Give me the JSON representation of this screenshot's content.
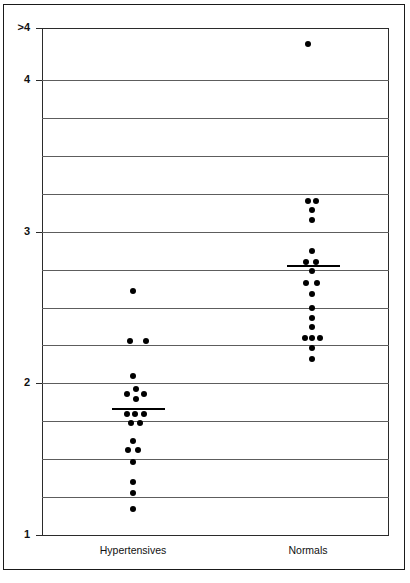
{
  "chart_data": {
    "type": "scatter",
    "title": "",
    "xlabel": "",
    "ylabel": "Average Rapid Left Ventricular Filling Rate (end-diastolic counts/sec)",
    "ylim": [
      1,
      4.35
    ],
    "ytick_labels": [
      ">4",
      "4",
      "3",
      "2",
      "1"
    ],
    "ytick_values": [
      4.34,
      4,
      3,
      2,
      1
    ],
    "gridlines": [
      4.0,
      3.75,
      3.5,
      3.25,
      3.0,
      2.75,
      2.5,
      2.25,
      2.0,
      1.75,
      1.5,
      1.25,
      1.0
    ],
    "grid": true,
    "legend": "none",
    "categories": [
      "Hypertensives",
      "Normals"
    ],
    "series": [
      {
        "name": "Hypertensives",
        "mean": 1.84,
        "n": 18,
        "points": [
          {
            "x": 0.0,
            "y": 2.61
          },
          {
            "x": -0.02,
            "y": 2.28
          },
          {
            "x": 0.085,
            "y": 2.28
          },
          {
            "x": 0.0,
            "y": 2.05
          },
          {
            "x": -0.04,
            "y": 1.93
          },
          {
            "x": 0.02,
            "y": 1.96
          },
          {
            "x": 0.02,
            "y": 1.9
          },
          {
            "x": 0.075,
            "y": 1.93
          },
          {
            "x": -0.04,
            "y": 1.8
          },
          {
            "x": 0.015,
            "y": 1.8
          },
          {
            "x": 0.075,
            "y": 1.8
          },
          {
            "x": -0.015,
            "y": 1.74
          },
          {
            "x": 0.045,
            "y": 1.74
          },
          {
            "x": 0.0,
            "y": 1.62
          },
          {
            "x": -0.035,
            "y": 1.56
          },
          {
            "x": 0.035,
            "y": 1.56
          },
          {
            "x": 0.0,
            "y": 1.48
          },
          {
            "x": 0.0,
            "y": 1.35
          },
          {
            "x": 0.0,
            "y": 1.28
          },
          {
            "x": 0.0,
            "y": 1.17
          }
        ]
      },
      {
        "name": "Normals",
        "mean": 2.78,
        "n": 20,
        "points": [
          {
            "x": 0.0,
            "y": 4.24
          },
          {
            "x": 0.0,
            "y": 3.2
          },
          {
            "x": 0.055,
            "y": 3.2
          },
          {
            "x": 0.025,
            "y": 3.14
          },
          {
            "x": 0.025,
            "y": 3.08
          },
          {
            "x": 0.025,
            "y": 2.87
          },
          {
            "x": -0.01,
            "y": 2.8
          },
          {
            "x": 0.055,
            "y": 2.8
          },
          {
            "x": 0.025,
            "y": 2.74
          },
          {
            "x": -0.01,
            "y": 2.66
          },
          {
            "x": 0.06,
            "y": 2.66
          },
          {
            "x": 0.025,
            "y": 2.59
          },
          {
            "x": 0.025,
            "y": 2.5
          },
          {
            "x": 0.025,
            "y": 2.43
          },
          {
            "x": 0.025,
            "y": 2.37
          },
          {
            "x": -0.02,
            "y": 2.3
          },
          {
            "x": 0.025,
            "y": 2.3
          },
          {
            "x": 0.08,
            "y": 2.3
          },
          {
            "x": 0.025,
            "y": 2.23
          },
          {
            "x": 0.025,
            "y": 2.16
          }
        ]
      }
    ]
  },
  "axis": {
    "y_title": "Average Rapid Left Ventricular Filling Rate (end-diastolic counts/sec)",
    "ticks": [
      {
        "label": ">4",
        "value": 4.34
      },
      {
        "label": "4",
        "value": 4
      },
      {
        "label": "3",
        "value": 3
      },
      {
        "label": "2",
        "value": 2
      },
      {
        "label": "1",
        "value": 1
      }
    ]
  },
  "groups": [
    {
      "label": "Hypertensives"
    },
    {
      "label": "Normals"
    }
  ]
}
